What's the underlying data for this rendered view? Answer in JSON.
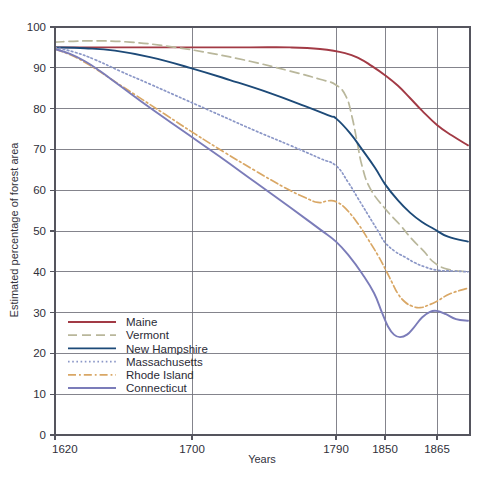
{
  "chart_data": {
    "type": "line",
    "title": "",
    "xlabel": "Years",
    "ylabel": "Estimated percentage of forest area",
    "xticks": [
      1620,
      1700,
      1790,
      1850,
      1865
    ],
    "xtick_labels": [
      "1620",
      "1700",
      "1790",
      "1850",
      "1865"
    ],
    "xtick_positions_px": [
      55,
      192,
      336,
      385,
      437
    ],
    "x_axis_max_px": 470,
    "x_axis_note": "non-linear time axis; right edge extends past 1865",
    "yticks": [
      0,
      10,
      20,
      30,
      40,
      50,
      60,
      70,
      80,
      90,
      100
    ],
    "ytick_labels": [
      "0",
      "10",
      "20",
      "30",
      "40",
      "50",
      "60",
      "70",
      "80",
      "90",
      "100"
    ],
    "ylim": [
      0,
      100
    ],
    "grid": true,
    "legend_position": "lower-left-inside",
    "series": [
      {
        "name": "Maine",
        "color": "#a23a45",
        "style": "solid",
        "points": [
          [
            55,
            95.0
          ],
          [
            100,
            95.0
          ],
          [
            150,
            95.0
          ],
          [
            200,
            95.0
          ],
          [
            250,
            95.0
          ],
          [
            290,
            95.0
          ],
          [
            320,
            94.6
          ],
          [
            345,
            93.6
          ],
          [
            360,
            92.2
          ],
          [
            372,
            90.4
          ],
          [
            385,
            88.2
          ],
          [
            398,
            85.6
          ],
          [
            410,
            82.6
          ],
          [
            422,
            79.5
          ],
          [
            437,
            76.0
          ],
          [
            452,
            73.4
          ],
          [
            468,
            71.0
          ]
        ]
      },
      {
        "name": "Vermont",
        "color": "#b9b79b",
        "style": "dashed",
        "points": [
          [
            55,
            96.3
          ],
          [
            90,
            96.6
          ],
          [
            130,
            96.3
          ],
          [
            170,
            95.2
          ],
          [
            210,
            93.6
          ],
          [
            250,
            91.6
          ],
          [
            290,
            89.2
          ],
          [
            320,
            87.2
          ],
          [
            336,
            85.8
          ],
          [
            346,
            83.0
          ],
          [
            352,
            78.0
          ],
          [
            357,
            72.0
          ],
          [
            362,
            66.0
          ],
          [
            370,
            60.5
          ],
          [
            385,
            55.5
          ],
          [
            400,
            51.5
          ],
          [
            412,
            48.0
          ],
          [
            424,
            45.0
          ],
          [
            434,
            42.3
          ],
          [
            448,
            40.6
          ],
          [
            468,
            40.0
          ]
        ]
      },
      {
        "name": "New Hampshire",
        "color": "#1d4a78",
        "style": "solid",
        "points": [
          [
            55,
            95.0
          ],
          [
            85,
            94.8
          ],
          [
            115,
            94.2
          ],
          [
            150,
            92.6
          ],
          [
            190,
            90.0
          ],
          [
            230,
            87.0
          ],
          [
            270,
            83.8
          ],
          [
            305,
            80.6
          ],
          [
            330,
            78.2
          ],
          [
            336,
            77.6
          ],
          [
            350,
            74.0
          ],
          [
            362,
            70.0
          ],
          [
            375,
            65.5
          ],
          [
            385,
            61.5
          ],
          [
            398,
            57.5
          ],
          [
            410,
            54.5
          ],
          [
            422,
            52.2
          ],
          [
            434,
            50.5
          ],
          [
            448,
            48.6
          ],
          [
            468,
            47.4
          ]
        ]
      },
      {
        "name": "Massachusetts",
        "color": "#8b97c7",
        "style": "dotted",
        "points": [
          [
            55,
            95.0
          ],
          [
            75,
            93.8
          ],
          [
            95,
            92.0
          ],
          [
            120,
            89.2
          ],
          [
            150,
            86.0
          ],
          [
            185,
            82.2
          ],
          [
            220,
            78.4
          ],
          [
            255,
            74.6
          ],
          [
            290,
            71.0
          ],
          [
            320,
            67.8
          ],
          [
            336,
            66.0
          ],
          [
            348,
            62.0
          ],
          [
            358,
            58.0
          ],
          [
            368,
            54.0
          ],
          [
            378,
            50.0
          ],
          [
            385,
            47.2
          ],
          [
            395,
            45.0
          ],
          [
            405,
            43.6
          ],
          [
            415,
            42.2
          ],
          [
            425,
            41.2
          ],
          [
            437,
            40.4
          ],
          [
            452,
            40.2
          ],
          [
            468,
            40.0
          ]
        ]
      },
      {
        "name": "Rhode Island",
        "color": "#d9a765",
        "style": "dashdot",
        "points": [
          [
            55,
            94.6
          ],
          [
            72,
            93.0
          ],
          [
            90,
            90.6
          ],
          [
            110,
            87.4
          ],
          [
            135,
            83.4
          ],
          [
            165,
            78.6
          ],
          [
            195,
            73.8
          ],
          [
            225,
            69.2
          ],
          [
            255,
            64.8
          ],
          [
            285,
            60.6
          ],
          [
            305,
            58.2
          ],
          [
            318,
            57.0
          ],
          [
            328,
            57.4
          ],
          [
            336,
            57.2
          ],
          [
            346,
            55.4
          ],
          [
            358,
            51.8
          ],
          [
            368,
            48.0
          ],
          [
            378,
            44.0
          ],
          [
            385,
            40.8
          ],
          [
            392,
            37.4
          ],
          [
            398,
            34.6
          ],
          [
            405,
            32.6
          ],
          [
            412,
            31.6
          ],
          [
            420,
            31.2
          ],
          [
            428,
            31.8
          ],
          [
            437,
            32.8
          ],
          [
            450,
            34.6
          ],
          [
            468,
            36.0
          ]
        ]
      },
      {
        "name": "Connecticut",
        "color": "#7b7cb9",
        "style": "solid",
        "points": [
          [
            55,
            94.6
          ],
          [
            70,
            93.4
          ],
          [
            85,
            91.6
          ],
          [
            100,
            89.2
          ],
          [
            120,
            85.6
          ],
          [
            150,
            80.2
          ],
          [
            185,
            74.2
          ],
          [
            220,
            68.2
          ],
          [
            255,
            62.0
          ],
          [
            290,
            55.8
          ],
          [
            320,
            50.4
          ],
          [
            336,
            47.4
          ],
          [
            350,
            43.6
          ],
          [
            362,
            39.6
          ],
          [
            374,
            34.8
          ],
          [
            382,
            30.0
          ],
          [
            388,
            26.6
          ],
          [
            394,
            24.6
          ],
          [
            400,
            24.0
          ],
          [
            407,
            24.6
          ],
          [
            414,
            26.4
          ],
          [
            422,
            28.8
          ],
          [
            430,
            30.2
          ],
          [
            437,
            30.4
          ],
          [
            446,
            29.6
          ],
          [
            456,
            28.4
          ],
          [
            468,
            28.0
          ]
        ]
      }
    ]
  },
  "axis": {
    "y_title": "Estimated percentage of forest area",
    "x_title": "Years"
  },
  "legend": {
    "items": [
      {
        "label": "Maine",
        "color": "#a23a45",
        "style": "solid"
      },
      {
        "label": "Vermont",
        "color": "#b9b79b",
        "style": "dashed"
      },
      {
        "label": "New Hampshire",
        "color": "#1d4a78",
        "style": "solid"
      },
      {
        "label": "Massachusetts",
        "color": "#8b97c7",
        "style": "dotted"
      },
      {
        "label": "Rhode Island",
        "color": "#d9a765",
        "style": "dashdot"
      },
      {
        "label": "Connecticut",
        "color": "#7b7cb9",
        "style": "solid"
      }
    ]
  }
}
